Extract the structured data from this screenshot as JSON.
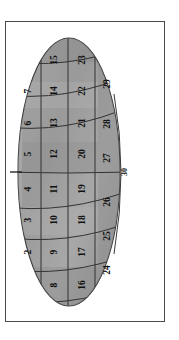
{
  "figure": {
    "title": "",
    "orientation": "rotated-90",
    "shape": "ellipse",
    "background_color": "#ffffff",
    "frame_color": "#4a4a4a",
    "fill_color": "#9c9c9c",
    "fill_color_light": "#b0b0b0",
    "fill_color_dark": "#8a8a8a",
    "line_color": "#3a3a3a",
    "label_color": "#111111"
  },
  "chart_data": {
    "type": "diagram",
    "title": "",
    "region_count": 30,
    "columns": [
      {
        "name": "column-1",
        "labels": [
          "2",
          "3",
          "4",
          "5",
          "6",
          "7"
        ]
      },
      {
        "name": "column-2",
        "labels": [
          "8",
          "9",
          "10",
          "11",
          "12",
          "13",
          "14",
          "15"
        ]
      },
      {
        "name": "column-3",
        "labels": [
          "16",
          "17",
          "18",
          "19",
          "20",
          "21",
          "22",
          "23"
        ]
      },
      {
        "name": "column-4",
        "labels": [
          "24",
          "25",
          "26",
          "27",
          "28",
          "29"
        ]
      }
    ],
    "edge_labels": [
      {
        "name": "tick-label-1",
        "text": "1",
        "position": "left-edge-center"
      },
      {
        "name": "edge-label-30",
        "text": "30",
        "position": "right-edge-center"
      }
    ],
    "cells": [
      {
        "id": "cell-2",
        "label": "2",
        "cx": 22,
        "cy": 230
      },
      {
        "id": "cell-3",
        "label": "3",
        "cx": 22,
        "cy": 198
      },
      {
        "id": "cell-4",
        "label": "4",
        "cx": 22,
        "cy": 167
      },
      {
        "id": "cell-5",
        "label": "5",
        "cx": 22,
        "cy": 132
      },
      {
        "id": "cell-6",
        "label": "6",
        "cx": 22,
        "cy": 101
      },
      {
        "id": "cell-7",
        "label": "7",
        "cx": 22,
        "cy": 69
      },
      {
        "id": "cell-8",
        "label": "8",
        "cx": 48,
        "cy": 263
      },
      {
        "id": "cell-9",
        "label": "9",
        "cx": 48,
        "cy": 230
      },
      {
        "id": "cell-10",
        "label": "10",
        "cx": 48,
        "cy": 198
      },
      {
        "id": "cell-11",
        "label": "11",
        "cx": 48,
        "cy": 167
      },
      {
        "id": "cell-12",
        "label": "12",
        "cx": 48,
        "cy": 132
      },
      {
        "id": "cell-13",
        "label": "13",
        "cx": 48,
        "cy": 101
      },
      {
        "id": "cell-14",
        "label": "14",
        "cx": 48,
        "cy": 69
      },
      {
        "id": "cell-15",
        "label": "15",
        "cx": 48,
        "cy": 38
      },
      {
        "id": "cell-16",
        "label": "16",
        "cx": 76,
        "cy": 263
      },
      {
        "id": "cell-17",
        "label": "17",
        "cx": 76,
        "cy": 230
      },
      {
        "id": "cell-18",
        "label": "18",
        "cx": 76,
        "cy": 198
      },
      {
        "id": "cell-19",
        "label": "19",
        "cx": 76,
        "cy": 167
      },
      {
        "id": "cell-20",
        "label": "20",
        "cx": 76,
        "cy": 132
      },
      {
        "id": "cell-21",
        "label": "21",
        "cx": 76,
        "cy": 101
      },
      {
        "id": "cell-22",
        "label": "22",
        "cx": 76,
        "cy": 69
      },
      {
        "id": "cell-23",
        "label": "23",
        "cx": 76,
        "cy": 38
      },
      {
        "id": "cell-24",
        "label": "24",
        "cx": 101,
        "cy": 248
      },
      {
        "id": "cell-25",
        "label": "25",
        "cx": 101,
        "cy": 214
      },
      {
        "id": "cell-26",
        "label": "26",
        "cx": 101,
        "cy": 180
      },
      {
        "id": "cell-27",
        "label": "27",
        "cx": 101,
        "cy": 136
      },
      {
        "id": "cell-28",
        "label": "28",
        "cx": 101,
        "cy": 102
      },
      {
        "id": "cell-29",
        "label": "29",
        "cx": 101,
        "cy": 62
      }
    ]
  }
}
